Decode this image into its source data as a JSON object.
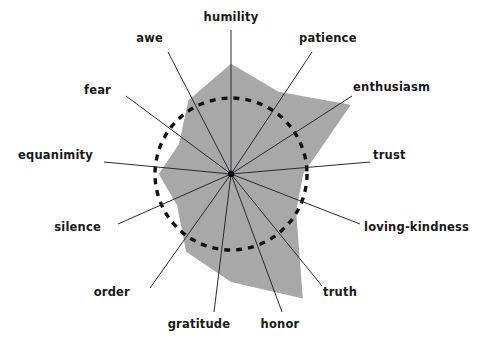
{
  "chart_data": {
    "type": "radar",
    "title": "",
    "subtitle": "",
    "xlabel": "",
    "ylabel": "",
    "grid": false,
    "legend": "none",
    "reference_circle": {
      "label": "baseline",
      "value": 1.0,
      "style": "dashed",
      "color": "#101012"
    },
    "rlim": [
      0,
      2.0
    ],
    "categories": [
      "humility",
      "patience",
      "enthusiasm",
      "trust",
      "loving-kindness",
      "truth",
      "honor",
      "gratitude",
      "order",
      "silence",
      "equanimity",
      "fear",
      "awe"
    ],
    "series": [
      {
        "name": "profile",
        "fill_color": "#a8a8a8",
        "values": [
          1.45,
          1.25,
          1.82,
          0.95,
          0.99,
          1.89,
          1.42,
          1.18,
          0.82,
          0.95,
          0.79,
          1.12,
          1.32
        ]
      }
    ],
    "axis_angles_deg": [
      0,
      30,
      60,
      90,
      120,
      150,
      180,
      210,
      240,
      270,
      300,
      330
    ],
    "geometry": {
      "center_x": 231,
      "center_y": 174,
      "unit_radius": 76,
      "axis_line_color": "#2a2a2e",
      "axis_line_width": 1
    }
  },
  "labels": {
    "humility": "humility",
    "patience": "patience",
    "enthusiasm": "enthusiasm",
    "trust": "trust",
    "loving_kindness": "loving-kindness",
    "truth": "truth",
    "honor": "honor",
    "gratitude": "gratitude",
    "order": "order",
    "silence": "silence",
    "equanimity": "equanimity",
    "fear": "fear",
    "awe": "awe"
  },
  "colors": {
    "background": "#ffffff",
    "polygon_fill": "#a8a8a8",
    "axis_line": "#2a2a2e",
    "dashed_circle": "#101012",
    "label_text": "#18181a"
  }
}
